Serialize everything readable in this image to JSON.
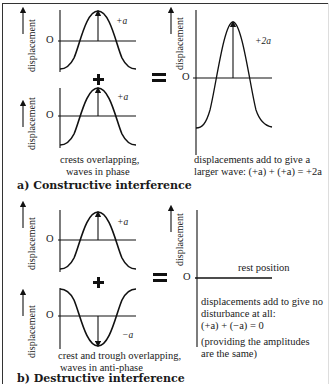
{
  "colors": {
    "ink": "#1a1a1a",
    "background": "#ffffff"
  },
  "axis_label": "displacement",
  "origin_label": "O",
  "section_a": {
    "caption": "a)  Constructive interference",
    "wave1": {
      "amplitude_label": "+a"
    },
    "wave2": {
      "amplitude_label": "+a"
    },
    "operator_plus": "+",
    "operator_equals": "=",
    "left_note": [
      "crests overlapping,",
      "waves in phase"
    ],
    "result": {
      "amplitude_label": "+2a"
    },
    "right_note": [
      "displacements add to give a",
      "larger wave: (+a) + (+a) = +2a"
    ]
  },
  "section_b": {
    "caption": "b)  Destructive interference",
    "wave1": {
      "amplitude_label": "+a"
    },
    "wave2": {
      "amplitude_label": "−a"
    },
    "operator_plus": "+",
    "operator_equals": "=",
    "left_note": [
      "crest and trough overlapping,",
      "waves in anti-phase"
    ],
    "result": {
      "line_label": "rest position"
    },
    "right_note": [
      "displacements add to give no",
      "disturbance at all:",
      "(+a) + (−a) = 0"
    ],
    "right_note_2": [
      "(providing the amplitudes",
      " are the same)"
    ]
  }
}
